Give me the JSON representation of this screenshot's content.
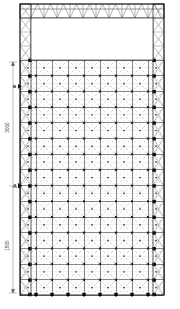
{
  "drawing": {
    "type": "structural-elevation",
    "title": "",
    "background_color": "#ffffff",
    "line_color": "#1a1a1a",
    "brace_color": "#6e6e6e",
    "node_color": "#111111"
  },
  "frame": {
    "outer": {
      "x": 20,
      "y": 4,
      "width": 144,
      "height": 291
    },
    "top_truss": {
      "name": "top-chord-truss",
      "x": 20,
      "y": 4,
      "width": 144,
      "height": 14,
      "panels": 11,
      "web_pattern": "warren-zigzag"
    },
    "left_truss": {
      "name": "left-column-truss",
      "x": 20,
      "y": 4,
      "width": 11,
      "height": 291,
      "panels": 18,
      "web_pattern": "x-brace"
    },
    "right_truss": {
      "name": "right-column-truss",
      "x": 153,
      "y": 4,
      "width": 11,
      "height": 291,
      "panels": 18,
      "web_pattern": "x-brace"
    },
    "opening": {
      "name": "upper-open-bay",
      "x": 31,
      "y": 18,
      "width": 122,
      "height": 42
    }
  },
  "grid_panel": {
    "name": "braced-grid-panel",
    "x": 20,
    "y": 60,
    "width": 144,
    "height": 235,
    "columns": 9,
    "rows": 15,
    "cell_width": 16.0,
    "cell_height": 15.6,
    "cell_brace": "x-diagonal-dashed",
    "node_marker": "filled-square",
    "edge_node_marker": "large-filled-square"
  },
  "dimensions": {
    "line": {
      "x": 12,
      "y_top": 62,
      "y_bottom": 293
    },
    "upper_label": "3000",
    "lower_label": "1500",
    "tick_style": "arrow"
  },
  "markers": {
    "section_b": "B",
    "section_a": "A"
  }
}
